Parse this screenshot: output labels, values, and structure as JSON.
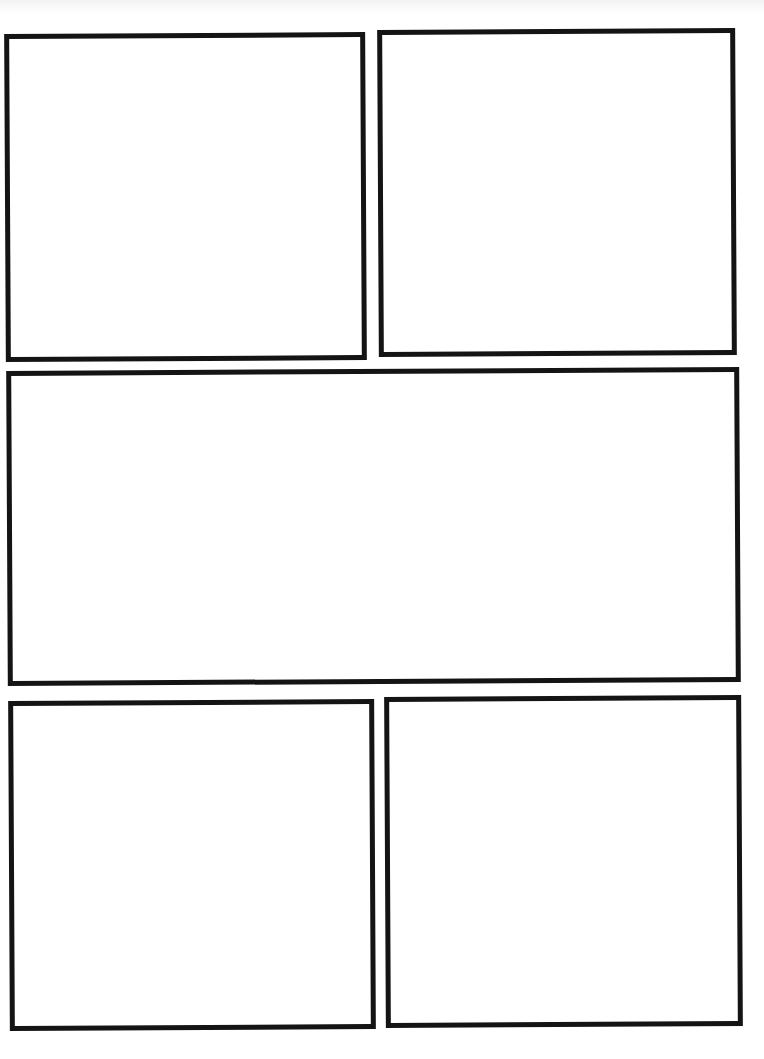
{
  "page": {
    "type": "comic-page-template",
    "background": "#ffffff",
    "border_color": "#141414",
    "panels": [
      {
        "id": 1,
        "label": "",
        "left": 5,
        "top": 33,
        "width": 361,
        "height": 328,
        "rotate": -0.3
      },
      {
        "id": 2,
        "label": "",
        "left": 378,
        "top": 29,
        "width": 358,
        "height": 327,
        "rotate": -0.3
      },
      {
        "id": 3,
        "label": "",
        "left": 7,
        "top": 369,
        "width": 733,
        "height": 315,
        "rotate": -0.3
      },
      {
        "id": 4,
        "label": "",
        "left": 9,
        "top": 700,
        "width": 366,
        "height": 330,
        "rotate": -0.3
      },
      {
        "id": 5,
        "label": "",
        "left": 385,
        "top": 696,
        "width": 357,
        "height": 331,
        "rotate": -0.3
      }
    ]
  }
}
